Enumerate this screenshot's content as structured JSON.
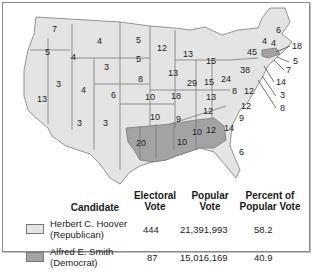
{
  "map": {
    "title": "1928 Presidential Election",
    "colors": {
      "hoover": "#e4e4e4",
      "smith": "#a3a3a3",
      "border": "#7a7a7a",
      "water": "#ffffff"
    },
    "state_labels": [
      {
        "state": "WA",
        "value": "7",
        "winner": "hoover"
      },
      {
        "state": "OR",
        "value": "5",
        "winner": "hoover"
      },
      {
        "state": "CA",
        "value": "13",
        "winner": "hoover"
      },
      {
        "state": "ID",
        "value": "4",
        "winner": "hoover"
      },
      {
        "state": "NV",
        "value": "3",
        "winner": "hoover"
      },
      {
        "state": "MT",
        "value": "4",
        "winner": "hoover"
      },
      {
        "state": "WY",
        "value": "3",
        "winner": "hoover"
      },
      {
        "state": "UT",
        "value": "4",
        "winner": "hoover"
      },
      {
        "state": "CO",
        "value": "6",
        "winner": "hoover"
      },
      {
        "state": "AZ",
        "value": "3",
        "winner": "hoover"
      },
      {
        "state": "NM",
        "value": "3",
        "winner": "hoover"
      },
      {
        "state": "ND",
        "value": "5",
        "winner": "hoover"
      },
      {
        "state": "SD",
        "value": "5",
        "winner": "hoover"
      },
      {
        "state": "NE",
        "value": "8",
        "winner": "hoover"
      },
      {
        "state": "KS",
        "value": "10",
        "winner": "hoover"
      },
      {
        "state": "OK",
        "value": "10",
        "winner": "hoover"
      },
      {
        "state": "TX",
        "value": "20",
        "winner": "hoover"
      },
      {
        "state": "MN",
        "value": "12",
        "winner": "hoover"
      },
      {
        "state": "IA",
        "value": "13",
        "winner": "hoover"
      },
      {
        "state": "MO",
        "value": "18",
        "winner": "hoover"
      },
      {
        "state": "AR",
        "value": "9",
        "winner": "smith"
      },
      {
        "state": "LA",
        "value": "10",
        "winner": "smith"
      },
      {
        "state": "WI",
        "value": "13",
        "winner": "hoover"
      },
      {
        "state": "IL",
        "value": "29",
        "winner": "hoover"
      },
      {
        "state": "MI",
        "value": "15",
        "winner": "hoover"
      },
      {
        "state": "IN",
        "value": "15",
        "winner": "hoover"
      },
      {
        "state": "OH",
        "value": "24",
        "winner": "hoover"
      },
      {
        "state": "KY",
        "value": "13",
        "winner": "hoover"
      },
      {
        "state": "TN",
        "value": "12",
        "winner": "hoover"
      },
      {
        "state": "MS",
        "value": "10",
        "winner": "smith"
      },
      {
        "state": "AL",
        "value": "12",
        "winner": "smith"
      },
      {
        "state": "GA",
        "value": "14",
        "winner": "smith"
      },
      {
        "state": "FL",
        "value": "6",
        "winner": "hoover"
      },
      {
        "state": "SC",
        "value": "9",
        "winner": "smith"
      },
      {
        "state": "NC",
        "value": "12",
        "winner": "hoover"
      },
      {
        "state": "VA",
        "value": "12",
        "winner": "hoover"
      },
      {
        "state": "WV",
        "value": "8",
        "winner": "hoover"
      },
      {
        "state": "PA",
        "value": "38",
        "winner": "hoover"
      },
      {
        "state": "NY",
        "value": "45",
        "winner": "hoover"
      },
      {
        "state": "VT",
        "value": "4",
        "winner": "hoover"
      },
      {
        "state": "NH",
        "value": "4",
        "winner": "hoover"
      },
      {
        "state": "ME",
        "value": "6",
        "winner": "hoover"
      },
      {
        "state": "MA",
        "value": "18",
        "winner": "smith"
      },
      {
        "state": "RI",
        "value": "5",
        "winner": "smith"
      },
      {
        "state": "CT",
        "value": "7",
        "winner": "hoover"
      },
      {
        "state": "NJ",
        "value": "14",
        "winner": "hoover"
      },
      {
        "state": "DE",
        "value": "3",
        "winner": "hoover"
      },
      {
        "state": "MD",
        "value": "8",
        "winner": "hoover"
      }
    ]
  },
  "table": {
    "headers": {
      "candidate": "Candidate",
      "electoral_1": "Electoral",
      "electoral_2": "Vote",
      "popular_1": "Popular",
      "popular_2": "Vote",
      "percent_1": "Percent of",
      "percent_2": "Popular Vote"
    },
    "rows": [
      {
        "name": "Herbert C. Hoover",
        "party": "(Republican)",
        "electoral": "444",
        "popular": "21,391,993",
        "percent": "58.2",
        "swatch": "#e4e4e4"
      },
      {
        "name": "Alfred E. Smith",
        "party": "(Democrat)",
        "electoral": "87",
        "popular": "15,016,169",
        "percent": "40.9",
        "swatch": "#a3a3a3"
      }
    ]
  }
}
